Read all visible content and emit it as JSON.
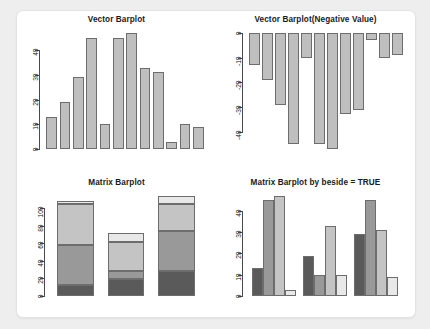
{
  "page": {
    "background_color": "#eeeeee",
    "card_color": "#ffffff"
  },
  "palette": {
    "vector_bar_fill": "#bfbfbf",
    "bar_border": "#6d6d6d",
    "axis_color": "#4a4a4a",
    "series_1": "#5a5a5a",
    "series_2": "#999999",
    "series_3": "#c4c4c4",
    "series_4": "#e8e8e8"
  },
  "panels": [
    {
      "name": "vector-barplot",
      "title": "Vector Barplot"
    },
    {
      "name": "vector-barplot-negative",
      "title": "Vector Barplot(Negative Value)"
    },
    {
      "name": "matrix-barplot",
      "title": "Matrix Barplot"
    },
    {
      "name": "matrix-barplot-beside",
      "title": "Matrix Barplot by beside = TRUE"
    }
  ],
  "chart_data": [
    {
      "type": "bar",
      "title": "Vector Barplot",
      "xlabel": "",
      "ylabel": "",
      "categories": [
        "1",
        "2",
        "3",
        "4",
        "5",
        "6",
        "7",
        "8",
        "9",
        "10",
        "11",
        "12"
      ],
      "values": [
        13,
        19,
        29,
        45,
        10,
        45,
        47,
        33,
        31,
        3,
        10,
        9
      ],
      "ylim": [
        0,
        47
      ],
      "yticks": [
        0,
        10,
        20,
        30,
        40
      ],
      "ytick_labels": [
        "0",
        "10",
        "20",
        "30",
        "40"
      ],
      "grid": false,
      "legend": "none",
      "bar_color": "#bfbfbf"
    },
    {
      "type": "bar",
      "title": "Vector Barplot(Negative Value)",
      "xlabel": "",
      "ylabel": "",
      "categories": [
        "1",
        "2",
        "3",
        "4",
        "5",
        "6",
        "7",
        "8",
        "9",
        "10",
        "11",
        "12"
      ],
      "values": [
        -13,
        -19,
        -29,
        -45,
        -10,
        -45,
        -47,
        -33,
        -31,
        -3,
        -10,
        -9
      ],
      "ylim": [
        -47,
        0
      ],
      "yticks": [
        0,
        -10,
        -20,
        -30,
        -40
      ],
      "ytick_labels": [
        "0",
        "-10",
        "-20",
        "-30",
        "-40"
      ],
      "grid": false,
      "legend": "none",
      "bar_color": "#bfbfbf"
    },
    {
      "type": "bar",
      "subtype": "stacked",
      "title": "Matrix Barplot",
      "xlabel": "",
      "ylabel": "",
      "categories": [
        "1",
        "2",
        "3"
      ],
      "series": [
        {
          "name": "row-1",
          "values": [
            13,
            19,
            29
          ],
          "color": "#5a5a5a"
        },
        {
          "name": "row-2",
          "values": [
            45,
            10,
            45
          ],
          "color": "#999999"
        },
        {
          "name": "row-3",
          "values": [
            47,
            33,
            31
          ],
          "color": "#c4c4c4"
        },
        {
          "name": "row-4",
          "values": [
            3,
            10,
            9
          ],
          "color": "#e8e8e8"
        }
      ],
      "totals": [
        108,
        72,
        114
      ],
      "ylim": [
        0,
        114
      ],
      "yticks": [
        0,
        20,
        40,
        60,
        80,
        100
      ],
      "ytick_labels": [
        "0",
        "20",
        "40",
        "60",
        "80",
        "100"
      ],
      "grid": false,
      "legend": "none"
    },
    {
      "type": "bar",
      "subtype": "grouped",
      "title": "Matrix Barplot by beside = TRUE",
      "xlabel": "",
      "ylabel": "",
      "categories": [
        "1",
        "2",
        "3"
      ],
      "series": [
        {
          "name": "row-1",
          "values": [
            13,
            19,
            29
          ],
          "color": "#5a5a5a"
        },
        {
          "name": "row-2",
          "values": [
            45,
            10,
            45
          ],
          "color": "#999999"
        },
        {
          "name": "row-3",
          "values": [
            47,
            33,
            31
          ],
          "color": "#c4c4c4"
        },
        {
          "name": "row-4",
          "values": [
            3,
            10,
            9
          ],
          "color": "#e8e8e8"
        }
      ],
      "ylim": [
        0,
        47
      ],
      "yticks": [
        0,
        10,
        20,
        30,
        40
      ],
      "ytick_labels": [
        "0",
        "10",
        "20",
        "30",
        "40"
      ],
      "grid": false,
      "legend": "none"
    }
  ]
}
